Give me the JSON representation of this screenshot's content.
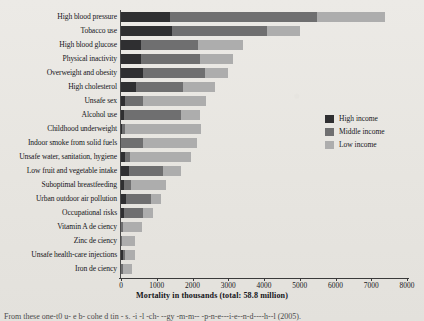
{
  "chart_data": {
    "type": "bar",
    "orientation": "horizontal",
    "stacked": true,
    "title": "",
    "xlabel": "Mortality in thousands  (total: 58.8 million)",
    "ylabel": "",
    "xlim": [
      0,
      8000
    ],
    "xticks": [
      "0",
      "1000",
      "2000",
      "3000",
      "4000",
      "5000",
      "6000",
      "7000",
      "8000"
    ],
    "grid": false,
    "legend_position": "right-middle",
    "categories": [
      "High blood pressure",
      "Tobacco use",
      "High blood glucose",
      "Physical inactivity",
      "Overweight and obesity",
      "High cholesterol",
      "Unsafe sex",
      "Alcohol use",
      "Childhood underweight",
      "Indoor smoke from solid fuels",
      "Unsafe water, sanitation, hygiene",
      "Low fruit and vegetable intake",
      "Suboptimal breastfeeding",
      "Urban outdoor air pollution",
      "Occupational risks",
      "Vitamin A de ciency",
      "Zinc de ciency",
      "Unsafe health-care injections",
      "Iron de ciency"
    ],
    "series": [
      {
        "name": "High income",
        "color": "#2f2f31",
        "values": [
          1370,
          1430,
          560,
          560,
          620,
          420,
          110,
          90,
          40,
          0,
          110,
          220,
          80,
          130,
          90,
          0,
          0,
          60,
          0
        ]
      },
      {
        "name": "Middle income",
        "color": "#6f6f70",
        "values": [
          4110,
          2650,
          1600,
          1650,
          1730,
          1320,
          500,
          1600,
          70,
          610,
          130,
          960,
          190,
          720,
          520,
          60,
          40,
          60,
          60
        ]
      },
      {
        "name": "Low income",
        "color": "#adadad",
        "values": [
          1900,
          930,
          1260,
          930,
          640,
          890,
          1770,
          520,
          2130,
          1510,
          1720,
          510,
          1000,
          280,
          280,
          520,
          350,
          270,
          250
        ]
      }
    ],
    "totals": [
      7380,
      5010,
      3420,
      3140,
      2990,
      2630,
      2380,
      2210,
      2240,
      2120,
      1960,
      1690,
      1270,
      1130,
      890,
      580,
      390,
      390,
      310
    ]
  },
  "legend": {
    "items": [
      {
        "label": "High income",
        "color": "#2f2f31"
      },
      {
        "label": "Middle income",
        "color": "#6f6f70"
      },
      {
        "label": "Low income",
        "color": "#adadad"
      }
    ]
  },
  "caption": {
    "text": "From these one-t0 u- e b- cohe d tin - s. -i -l -ch- --gy -m-m-- -p-n-e---i-e--n-d----h--l (2005)."
  }
}
